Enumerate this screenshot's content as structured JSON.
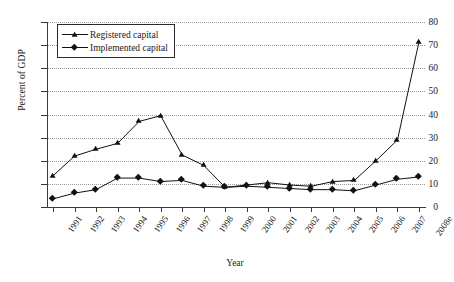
{
  "chart_data": {
    "type": "line",
    "title": "",
    "xlabel": "Year",
    "ylabel": "Percent of GDP",
    "categories": [
      "1991",
      "1992",
      "1993",
      "1994",
      "1995",
      "1996",
      "1997",
      "1998",
      "1999",
      "2000",
      "2001",
      "2002",
      "2003",
      "2004",
      "2005",
      "2006",
      "2007",
      "2008e"
    ],
    "ylim": [
      0,
      80
    ],
    "ytick_values": [
      0,
      10,
      20,
      30,
      40,
      50,
      60,
      70,
      80
    ],
    "grid": "horizontal-dotted",
    "legend_position": "upper-left-inside",
    "series": [
      {
        "name": "Registered capital",
        "marker": "triangle",
        "color": "#111111",
        "values": [
          13.5,
          22.0,
          25.0,
          27.5,
          37.0,
          39.5,
          22.5,
          18.0,
          8.5,
          9.5,
          10.5,
          9.5,
          9.0,
          11.0,
          11.5,
          20.0,
          29.0,
          71.5
        ]
      },
      {
        "name": "Implemented capital",
        "marker": "diamond",
        "color": "#111111",
        "values": [
          3.5,
          6.0,
          7.5,
          12.5,
          12.5,
          11.0,
          11.5,
          9.0,
          8.5,
          9.0,
          8.5,
          8.0,
          7.5,
          7.5,
          7.0,
          9.5,
          12.0,
          13.0
        ]
      }
    ]
  }
}
